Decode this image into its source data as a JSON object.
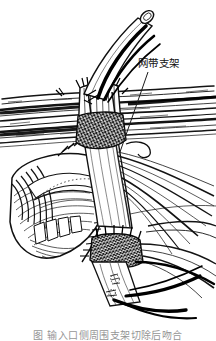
{
  "figure": {
    "kind": "medical-line-art-illustration",
    "style": "black-ink-engraving-hatching",
    "background_color": "#ffffff",
    "ink_color": "#121212",
    "width_px": 216,
    "height_px": 339
  },
  "annotations": [
    {
      "id": "mesh-band-support",
      "text": "网带支架",
      "leader_from": [
        148,
        72
      ],
      "leader_to": [
        120,
        152
      ]
    }
  ],
  "caption": {
    "text": "图  输入口侧周围支架切除后吻合",
    "truncated": true
  },
  "parts": {
    "tube_graft": "graft-tube-open-end",
    "mesh_collar_upper": "upper-mesh-band-ring",
    "mesh_collar_lower": "lower-mesh-band-ring",
    "tissue_flap": "left-tissue-flap",
    "fibrous_band": "horizontal-fibrous-band",
    "sutures": "dark-suture-strands",
    "suture_line": "running-suture-line"
  }
}
